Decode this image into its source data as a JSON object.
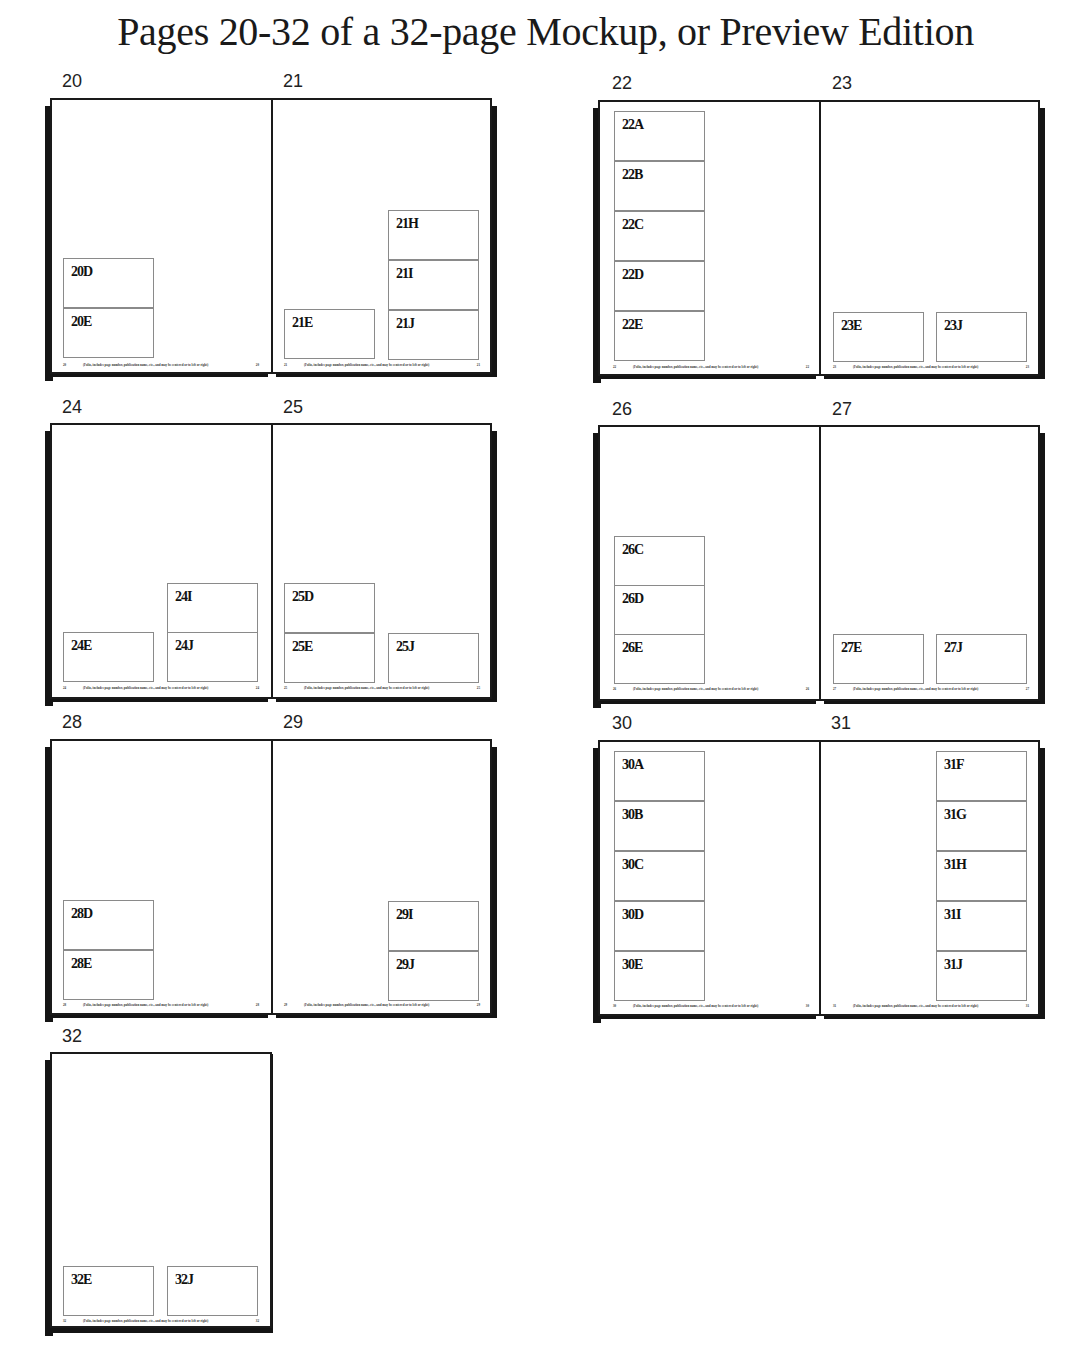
{
  "title": "Pages 20-32 of a 32-page Mockup, or Preview Edition",
  "folio_text": "(Folio, includes page number, publication name, etc., and may be centered or to left or right)",
  "spreads": [
    {
      "pages": [
        {
          "number": "20",
          "slots": [
            "20D",
            "20E"
          ]
        },
        {
          "number": "21",
          "slots": [
            "21E",
            "21H",
            "21I",
            "21J"
          ]
        }
      ]
    },
    {
      "pages": [
        {
          "number": "22",
          "slots": [
            "22A",
            "22B",
            "22C",
            "22D",
            "22E"
          ]
        },
        {
          "number": "23",
          "slots": [
            "23E",
            "23J"
          ]
        }
      ]
    },
    {
      "pages": [
        {
          "number": "24",
          "slots": [
            "24E",
            "24I",
            "24J"
          ]
        },
        {
          "number": "25",
          "slots": [
            "25D",
            "25E",
            "25J"
          ]
        }
      ]
    },
    {
      "pages": [
        {
          "number": "26",
          "slots": [
            "26C",
            "26D",
            "26E"
          ]
        },
        {
          "number": "27",
          "slots": [
            "27E",
            "27J"
          ]
        }
      ]
    },
    {
      "pages": [
        {
          "number": "28",
          "slots": [
            "28D",
            "28E"
          ]
        },
        {
          "number": "29",
          "slots": [
            "29I",
            "29J"
          ]
        }
      ]
    },
    {
      "pages": [
        {
          "number": "30",
          "slots": [
            "30A",
            "30B",
            "30C",
            "30D",
            "30E"
          ]
        },
        {
          "number": "31",
          "slots": [
            "31F",
            "31G",
            "31H",
            "31I",
            "31J"
          ]
        }
      ]
    },
    {
      "pages": [
        {
          "number": "32",
          "slots": [
            "32E",
            "32J"
          ]
        }
      ]
    }
  ]
}
